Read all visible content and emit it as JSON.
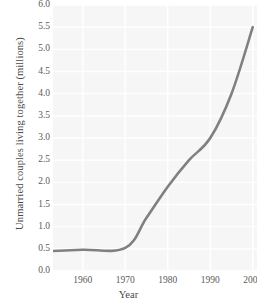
{
  "chart_data": {
    "type": "line",
    "title": "",
    "xlabel": "Year",
    "ylabel": "Unmarried couples living together (millions)",
    "xlim": [
      1953,
      2001
    ],
    "ylim": [
      0.0,
      6.0
    ],
    "grid": true,
    "legend": "none",
    "line_color": "#808080",
    "plot_background": "#f6f6f6",
    "gridline_color": "#ffffff",
    "xticks": [
      "1960",
      "1970",
      "1980",
      "1990",
      "2000"
    ],
    "xtick_values": [
      1960,
      1970,
      1980,
      1990,
      2000
    ],
    "yticks": [
      "0.0",
      "0.5",
      "1.0",
      "1.5",
      "2.0",
      "2.5",
      "3.0",
      "3.5",
      "4.0",
      "4.5",
      "5.0",
      "5.5",
      "6.0"
    ],
    "ytick_values": [
      0.0,
      0.5,
      1.0,
      1.5,
      2.0,
      2.5,
      3.0,
      3.5,
      4.0,
      4.5,
      5.0,
      5.5,
      6.0
    ],
    "x": [
      1953,
      1960,
      1970,
      1975,
      1980,
      1985,
      1990,
      1995,
      2000
    ],
    "values": [
      0.45,
      0.48,
      0.52,
      1.2,
      1.9,
      2.5,
      3.0,
      4.0,
      5.5
    ],
    "series": [
      {
        "name": "Unmarried couples living together",
        "x": [
          1953,
          1960,
          1970,
          1975,
          1980,
          1985,
          1990,
          1995,
          2000
        ],
        "values": [
          0.45,
          0.48,
          0.52,
          1.2,
          1.9,
          2.5,
          3.0,
          4.0,
          5.5
        ]
      }
    ]
  }
}
